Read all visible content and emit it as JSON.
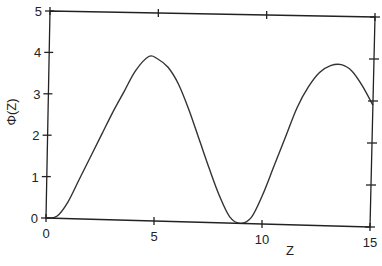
{
  "chart_data": {
    "type": "line",
    "title": "",
    "xlabel": "Z",
    "ylabel": "Φ(Z)",
    "xlim": [
      0,
      15
    ],
    "ylim": [
      0,
      5
    ],
    "xticks": [
      0,
      5,
      10,
      15
    ],
    "yticks": [
      0,
      1,
      2,
      3,
      4,
      5
    ],
    "xtick_labels": [
      "0",
      "5",
      "10",
      "15"
    ],
    "ytick_labels": [
      "0",
      "1",
      "2",
      "3",
      "4",
      "5"
    ],
    "grid": false,
    "legend": null,
    "series": [
      {
        "name": "Φ(Z)",
        "x": [
          0,
          0.5,
          1,
          1.5,
          2,
          2.5,
          3,
          3.5,
          4,
          4.6,
          5,
          5.5,
          6,
          6.5,
          7,
          7.5,
          8,
          8.5,
          9,
          9.5,
          10,
          10.5,
          11,
          11.5,
          12,
          12.5,
          13,
          13.5,
          14,
          14.5,
          15
        ],
        "y": [
          0,
          0.05,
          0.4,
          0.95,
          1.5,
          2.05,
          2.6,
          3.1,
          3.6,
          3.95,
          3.9,
          3.7,
          3.3,
          2.7,
          2.0,
          1.3,
          0.65,
          0.15,
          0.0,
          0.15,
          0.7,
          1.4,
          2.1,
          2.8,
          3.3,
          3.65,
          3.82,
          3.85,
          3.7,
          3.35,
          2.9
        ]
      }
    ]
  }
}
